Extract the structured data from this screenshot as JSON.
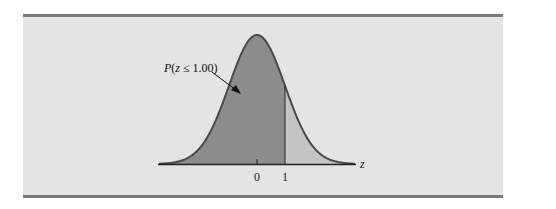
{
  "chart_data": {
    "type": "area",
    "title": "",
    "xlabel": "z",
    "ylabel": "",
    "x_ticks": [
      0,
      1
    ],
    "x_tick_labels": [
      "0",
      "1"
    ],
    "xlim": [
      -3.5,
      3.5
    ],
    "distribution": {
      "name": "standard normal",
      "mean": 0,
      "sd": 1
    },
    "shaded_region": {
      "from": "-inf",
      "to": 1.0,
      "label": "P(z ≤ 1.00)"
    },
    "unshaded_region": {
      "from": 1.0,
      "to": "inf"
    },
    "annotations": [
      {
        "text": "P(z ≤ 1.00)",
        "arrow_to": "shaded area left of z = 1"
      }
    ],
    "grid": false,
    "legend": null
  },
  "labels": {
    "annotation": "P(z ≤ 1.00)",
    "axis_label": "z",
    "tick_0": "0",
    "tick_1": "1"
  },
  "colors": {
    "panel_background": "#e4e4e4",
    "border_rule": "#7a7a7a",
    "shaded_fill": "#8c8c8c",
    "tail_fill": "#c4c4c4",
    "curve_stroke": "#4a4a4a",
    "axis": "#222222"
  }
}
